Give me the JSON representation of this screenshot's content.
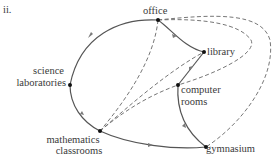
{
  "figure": {
    "label": "ii."
  },
  "nodes": {
    "office": {
      "line1": "office"
    },
    "library": {
      "line1": "library"
    },
    "science": {
      "line1": "science",
      "line2": "laboratories"
    },
    "computer": {
      "line1": "computer",
      "line2": "rooms"
    },
    "mathematics": {
      "line1": "mathematics",
      "line2": "classrooms"
    },
    "gymnasium": {
      "line1": "gymnasium"
    }
  },
  "edges": {
    "solid_directed": [
      {
        "from": "office",
        "to": "science laboratories"
      },
      {
        "from": "science laboratories",
        "to": "mathematics classrooms"
      },
      {
        "from": "mathematics classrooms",
        "to": "gymnasium"
      },
      {
        "from": "gymnasium",
        "to": "computer rooms"
      },
      {
        "from": "computer rooms",
        "to": "library"
      },
      {
        "from": "library",
        "to": "office"
      }
    ],
    "dashed": [
      {
        "from": "office",
        "to": "mathematics classrooms"
      },
      {
        "from": "mathematics classrooms",
        "to": "library"
      },
      {
        "from": "mathematics classrooms",
        "to": "computer rooms"
      },
      {
        "from": "office",
        "to": "computer rooms"
      },
      {
        "from": "office",
        "to": "gymnasium"
      }
    ]
  },
  "colors": {
    "edge": "#555555",
    "node": "#111111",
    "arrow": "#777777"
  }
}
